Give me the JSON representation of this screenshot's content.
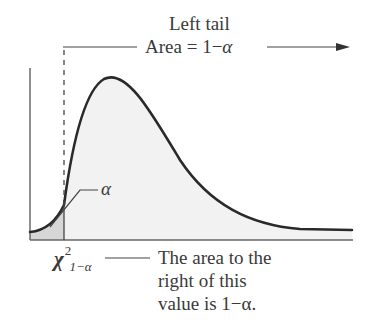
{
  "diagram": {
    "title": "Left tail",
    "area_label_prefix": "Area = 1−",
    "area_label_symbol": "α",
    "alpha_label": "α",
    "critical_value": {
      "symbol": "χ",
      "superscript": "2",
      "subscript": "1−α"
    },
    "note_lines": [
      "The area to the",
      "right of this",
      "value is 1−α."
    ],
    "colors": {
      "curve": "#2a2a2a",
      "fill_main": "#f2f2f2",
      "fill_tail": "#d6d6d6",
      "text": "#3a3a3a"
    }
  }
}
